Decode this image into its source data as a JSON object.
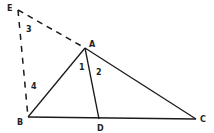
{
  "diagram": {
    "points": {
      "E": {
        "label": "E",
        "x": 18,
        "y": 10,
        "lx": 7,
        "ly": 11
      },
      "A": {
        "label": "A",
        "x": 85,
        "y": 48,
        "lx": 89,
        "ly": 47
      },
      "B": {
        "label": "B",
        "x": 28,
        "y": 117,
        "lx": 17,
        "ly": 125
      },
      "D": {
        "label": "D",
        "x": 99,
        "y": 119,
        "lx": 97,
        "ly": 131
      },
      "C": {
        "label": "C",
        "x": 196,
        "y": 119,
        "lx": 200,
        "ly": 122
      }
    },
    "angles": [
      {
        "label": "1",
        "x": 79,
        "y": 70
      },
      {
        "label": "2",
        "x": 96,
        "y": 75
      },
      {
        "label": "3",
        "x": 26,
        "y": 32
      },
      {
        "label": "4",
        "x": 31,
        "y": 89
      }
    ],
    "segments": [
      {
        "from": "A",
        "to": "B",
        "style": "solid"
      },
      {
        "from": "A",
        "to": "C",
        "style": "solid"
      },
      {
        "from": "B",
        "to": "C",
        "style": "solid"
      },
      {
        "from": "A",
        "to": "D",
        "style": "solid"
      },
      {
        "from": "E",
        "to": "A",
        "style": "dashed"
      },
      {
        "from": "E",
        "to": "B",
        "style": "dashed"
      }
    ],
    "line_color": "#1a1a1a"
  }
}
